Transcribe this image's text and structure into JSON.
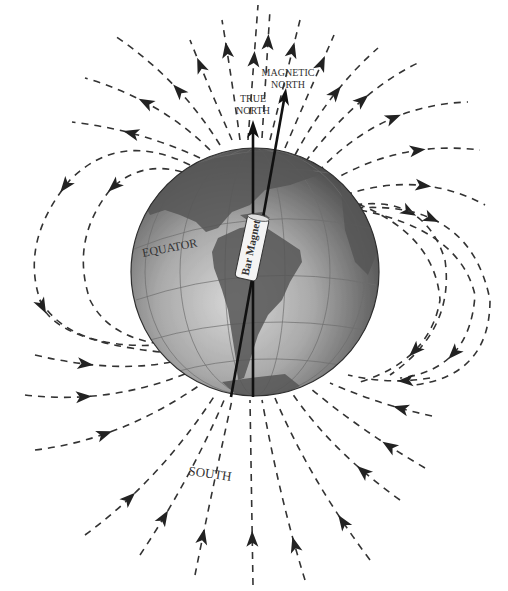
{
  "labels": {
    "true_north_line1": "TRUE",
    "true_north_line2": "NORTH",
    "magnetic_north_line1": "MAGNETIC",
    "magnetic_north_line2": "NORTH",
    "equator": "EQUATOR",
    "bar_magnet": "Bar Magnet",
    "south": "SOUTH"
  },
  "elements": {
    "globe": "Earth globe showing the Americas",
    "true_north_axis": "Geographic rotation axis",
    "magnetic_north_axis": "Magnetic axis, tilted from true north",
    "field_lines": "Dashed magnetic field lines leaving the north and returning at the south"
  },
  "colors": {
    "field_line": "#333333",
    "arrow": "#222222",
    "globe_dark": "#4a4a4a",
    "globe_light": "#c9c9c9",
    "land": "#555555",
    "magnet_body": "#f4f4f4"
  }
}
